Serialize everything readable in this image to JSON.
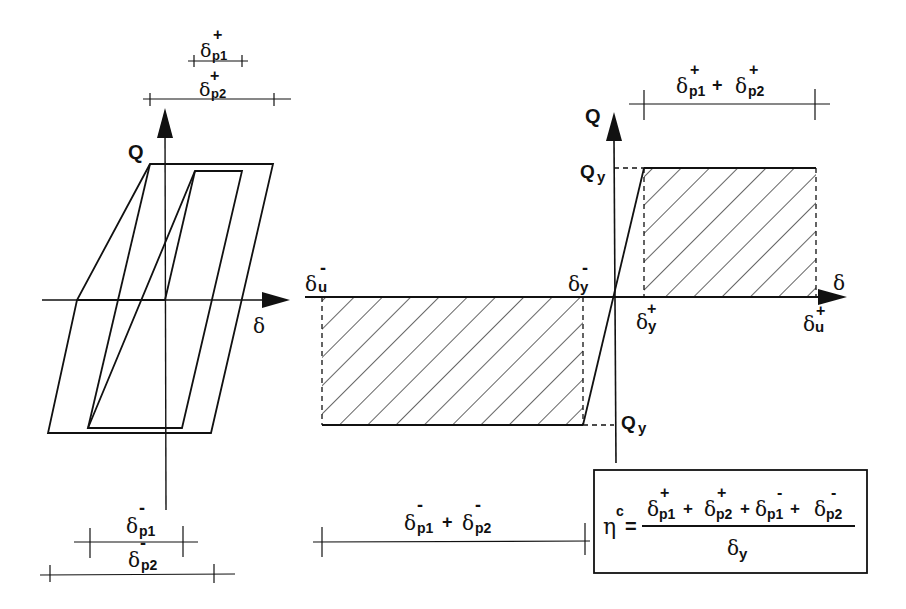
{
  "figure": {
    "left_plot": {
      "y_axis_label": "Q",
      "x_axis_label": "δ",
      "dims_top": [
        {
          "symbol": "δ",
          "sub": "p1",
          "sup": "+"
        },
        {
          "symbol": "δ",
          "sub": "p2",
          "sup": "+"
        }
      ],
      "dims_bottom": [
        {
          "symbol": "δ",
          "sub": "p1",
          "sup": "-"
        },
        {
          "symbol": "δ",
          "sub": "p2",
          "sup": "-"
        }
      ]
    },
    "right_plot": {
      "y_axis_label": "Q",
      "x_axis_label": "δ",
      "qy_top": {
        "symbol": "Q",
        "sub": "y"
      },
      "qy_bottom": {
        "symbol": "Q",
        "sub": "y"
      },
      "du_minus": {
        "symbol": "δ",
        "sub": "u",
        "sup": "-"
      },
      "dy_minus": {
        "symbol": "δ",
        "sub": "y",
        "sup": "-"
      },
      "dy_plus": {
        "symbol": "δ",
        "sub": "y",
        "sup": "+"
      },
      "du_plus": {
        "symbol": "δ",
        "sub": "u",
        "sup": "+"
      },
      "dim_top": {
        "a": {
          "symbol": "δ",
          "sub": "p1",
          "sup": "+"
        },
        "op": "+",
        "b": {
          "symbol": "δ",
          "sub": "p2",
          "sup": "+"
        }
      },
      "dim_bottom": {
        "a": {
          "symbol": "δ",
          "sub": "p1",
          "sup": "-"
        },
        "op": "+",
        "b": {
          "symbol": "δ",
          "sub": "p2",
          "sup": "-"
        }
      }
    },
    "formula": {
      "lhs": "η",
      "lhs_sup": "c",
      "equals": "=",
      "numerator": [
        {
          "symbol": "δ",
          "sub": "p1",
          "sup": "+"
        },
        {
          "op": "+"
        },
        {
          "symbol": "δ",
          "sub": "p2",
          "sup": "+"
        },
        {
          "op": "+"
        },
        {
          "symbol": "δ",
          "sub": "p1",
          "sup": "-"
        },
        {
          "op": "+"
        },
        {
          "symbol": "δ",
          "sub": "p2",
          "sup": "-"
        }
      ],
      "denominator": {
        "symbol": "δ",
        "sub": "y"
      }
    }
  }
}
